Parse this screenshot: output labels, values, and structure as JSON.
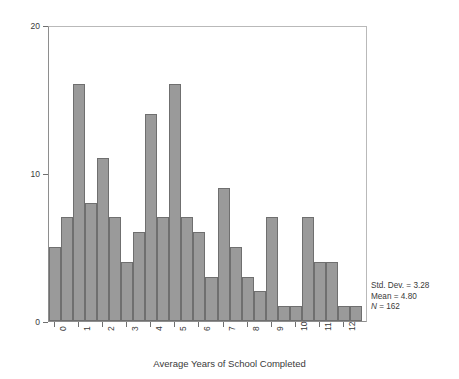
{
  "chart_data": {
    "type": "bar",
    "title": "",
    "xlabel": "Average Years of School Completed",
    "ylabel": "Frequency",
    "xlim": [
      -0.25,
      13.0
    ],
    "ylim": [
      0,
      20
    ],
    "bin_width": 0.5,
    "grid": false,
    "legend": null,
    "bar_color": "#9a9a9a",
    "bar_edge_color": "#6f6f6f",
    "xtick_labels": [
      "0",
      "1",
      "2",
      "3",
      "4",
      "5",
      "6",
      "7",
      "8",
      "9",
      "10",
      "11",
      "12"
    ],
    "xtick_values": [
      0,
      1,
      2,
      3,
      4,
      5,
      6,
      7,
      8,
      9,
      10,
      11,
      12
    ],
    "ytick_labels": [
      "0",
      "10",
      "20"
    ],
    "ytick_values": [
      0,
      10,
      20
    ],
    "bin_centers": [
      0.0,
      0.5,
      1.0,
      1.5,
      2.0,
      2.5,
      3.0,
      3.5,
      4.0,
      4.5,
      5.0,
      5.5,
      6.0,
      6.5,
      7.0,
      7.5,
      8.0,
      8.5,
      9.0,
      9.5,
      10.0,
      10.5,
      11.0,
      11.5,
      12.0,
      12.5
    ],
    "values": [
      5,
      7,
      16,
      8,
      11,
      7,
      4,
      6,
      14,
      7,
      16,
      7,
      6,
      3,
      9,
      5,
      3,
      2,
      7,
      1,
      1,
      7,
      4,
      4,
      1,
      1
    ],
    "annotations": {
      "std_dev_label": "Std. Dev. = 3.28",
      "mean_label": "Mean = 4.80",
      "n_label_prefix": "N",
      "n_label_rest": " = 162",
      "std_dev": 3.28,
      "mean": 4.8,
      "n": 162
    }
  },
  "axes": {
    "y_title": "Frequency",
    "x_title": "Average Years of School Completed"
  }
}
